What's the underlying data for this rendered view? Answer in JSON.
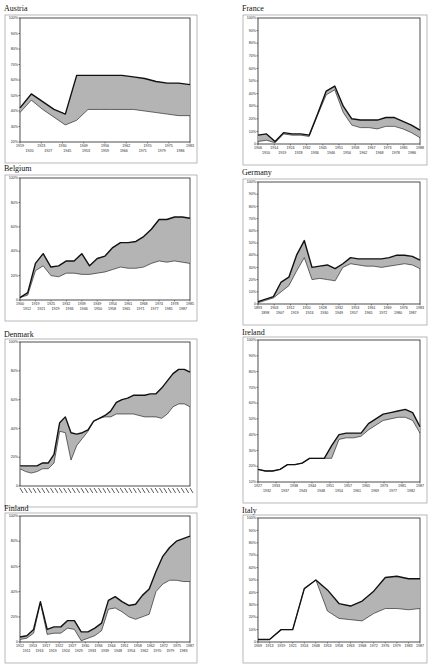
{
  "chart_data": [
    {
      "type": "area",
      "title": "Austria",
      "ylim": [
        20,
        100
      ],
      "yticks": [
        20,
        30,
        40,
        50,
        60,
        70,
        80,
        90,
        100
      ],
      "ytick_suffix": "%",
      "xticks_row1": [
        "1919",
        "1923",
        "1930",
        "1949",
        "1956",
        "1962",
        "1970",
        "1975",
        "1983"
      ],
      "xticks_row2": [
        "1920",
        "1927",
        "1945",
        "1953",
        "1959",
        "1966",
        "1971",
        "1979",
        "1986"
      ],
      "series": [
        {
          "name": "upper",
          "values": [
            42,
            51,
            46,
            41,
            38,
            63,
            63,
            63,
            63,
            63,
            62,
            61,
            59,
            58,
            58,
            57
          ]
        },
        {
          "name": "lower",
          "values": [
            39,
            47,
            41,
            36,
            31,
            34,
            41,
            41,
            41,
            41,
            41,
            40,
            39,
            38,
            37,
            37
          ]
        }
      ]
    },
    {
      "type": "area",
      "title": "France",
      "ylim": [
        0,
        100
      ],
      "yticks": [
        0,
        10,
        20,
        30,
        40,
        50,
        60,
        70,
        80,
        90,
        100
      ],
      "ytick_suffix": "%",
      "xticks_row1": [
        "1906",
        "1914",
        "1924",
        "1932",
        "1945",
        "1951",
        "1958",
        "1967",
        "1973",
        "1981",
        "1988"
      ],
      "xticks_row2": [
        "1910",
        "1919",
        "1928",
        "1936",
        "1946",
        "1956",
        "1962",
        "1968",
        "1978",
        "1986"
      ],
      "series": [
        {
          "name": "upper",
          "values": [
            7,
            8,
            2,
            9,
            8,
            8,
            7,
            24,
            42,
            46,
            30,
            20,
            19,
            19,
            19,
            21,
            21,
            18,
            15,
            11
          ]
        },
        {
          "name": "lower",
          "values": [
            2,
            3,
            1,
            8,
            7,
            7,
            6,
            23,
            39,
            43,
            25,
            15,
            13,
            13,
            12,
            14,
            14,
            12,
            9,
            5
          ]
        }
      ]
    },
    {
      "type": "area",
      "title": "Belgium",
      "ylim": [
        0,
        100
      ],
      "yticks": [
        0,
        20,
        40,
        60,
        80,
        100
      ],
      "ytick_suffix": "%",
      "xticks_row1": [
        "1900",
        "1919",
        "1925",
        "1932",
        "1939",
        "1949",
        "1954",
        "1961",
        "1968",
        "1974",
        "1978",
        "1985"
      ],
      "xticks_row2": [
        "1912",
        "1921",
        "1929",
        "1936",
        "1946",
        "1950",
        "1958",
        "1965",
        "1971",
        "1977",
        "1981",
        "1987"
      ],
      "series": [
        {
          "name": "upper",
          "values": [
            2,
            6,
            30,
            38,
            27,
            28,
            32,
            32,
            38,
            28,
            34,
            36,
            43,
            47,
            47,
            48,
            52,
            58,
            66,
            66,
            68,
            68,
            67
          ]
        },
        {
          "name": "lower",
          "values": [
            2,
            4,
            24,
            28,
            20,
            19,
            22,
            22,
            21,
            21,
            22,
            23,
            25,
            27,
            26,
            26,
            27,
            30,
            32,
            31,
            32,
            31,
            30
          ]
        }
      ]
    },
    {
      "type": "area",
      "title": "Germany",
      "ylim": [
        0,
        100
      ],
      "yticks": [
        0,
        10,
        20,
        30,
        40,
        50,
        60,
        70,
        80,
        90,
        100
      ],
      "ytick_suffix": "%",
      "xticks_row1": [
        "1893",
        "1903",
        "1912",
        "1920",
        "1928",
        "1932",
        "1953",
        "1961",
        "1969",
        "1976",
        "1983"
      ],
      "xticks_row2": [
        "1898",
        "1907",
        "1919",
        "1924",
        "1930",
        "1949",
        "1957",
        "1965",
        "1972",
        "1980",
        "1987"
      ],
      "series": [
        {
          "name": "upper",
          "values": [
            2,
            4,
            6,
            18,
            22,
            40,
            52,
            30,
            31,
            32,
            29,
            33,
            38,
            37,
            37,
            37,
            37,
            38,
            40,
            40,
            39,
            36
          ]
        },
        {
          "name": "lower",
          "values": [
            1,
            3,
            5,
            10,
            15,
            27,
            38,
            20,
            21,
            20,
            19,
            30,
            33,
            32,
            31,
            31,
            30,
            31,
            32,
            33,
            32,
            29
          ]
        }
      ]
    },
    {
      "type": "area",
      "title": "Denmark",
      "ylim": [
        0,
        100
      ],
      "yticks": [
        0,
        20,
        40,
        60,
        80,
        100
      ],
      "ytick_suffix": "%",
      "xticks_row1": [],
      "xticks_row2": [],
      "xticks_note": "rotated year labels, illegible",
      "series": [
        {
          "name": "upper",
          "values": [
            14,
            14,
            14,
            14,
            16,
            16,
            22,
            44,
            48,
            37,
            36,
            37,
            39,
            45,
            47,
            49,
            52,
            58,
            60,
            61,
            63,
            63,
            63,
            64,
            64,
            68,
            73,
            78,
            81,
            81,
            79
          ]
        },
        {
          "name": "lower",
          "values": [
            12,
            10,
            9,
            10,
            12,
            12,
            16,
            38,
            37,
            18,
            28,
            33,
            38,
            45,
            47,
            48,
            48,
            50,
            50,
            50,
            50,
            49,
            48,
            48,
            48,
            47,
            50,
            55,
            57,
            57,
            55
          ]
        }
      ]
    },
    {
      "type": "area",
      "title": "Ireland",
      "ylim": [
        10,
        100
      ],
      "yticks": [
        10,
        20,
        30,
        40,
        50,
        60,
        70,
        80,
        90,
        100
      ],
      "ytick_suffix": "%",
      "xticks_row1": [
        "1927",
        "1933",
        "1938",
        "1944",
        "1951",
        "1957",
        "1965",
        "1973",
        "1981",
        "1987"
      ],
      "xticks_row2": [
        "1932",
        "1937",
        "1943",
        "1948",
        "1954",
        "1961",
        "1969",
        "1977",
        "1982"
      ],
      "series": [
        {
          "name": "upper",
          "values": [
            18,
            17,
            17,
            18,
            21,
            21,
            22,
            25,
            25,
            25,
            33,
            40,
            41,
            41,
            41,
            47,
            50,
            53,
            54,
            55,
            56,
            54,
            45
          ]
        },
        {
          "name": "lower",
          "values": [
            18,
            17,
            17,
            18,
            21,
            21,
            22,
            25,
            25,
            25,
            25,
            37,
            38,
            38,
            39,
            43,
            46,
            49,
            50,
            51,
            51,
            49,
            41
          ]
        }
      ]
    },
    {
      "type": "area",
      "title": "Finland",
      "ylim": [
        0,
        100
      ],
      "yticks": [
        0,
        20,
        40,
        60,
        80,
        100
      ],
      "ytick_suffix": "%",
      "xticks_row1": [
        "1912",
        "1913",
        "1917",
        "1922",
        "1927",
        "1930",
        "1936",
        "1944",
        "1951",
        "1958",
        "1962",
        "1972",
        "1975",
        "1987"
      ],
      "xticks_row2": [
        "1911",
        "1916",
        "1919",
        "1924",
        "1929",
        "1933",
        "1939",
        "1948",
        "1954",
        "1962",
        "1970",
        "1979",
        "1983"
      ],
      "series": [
        {
          "name": "upper",
          "values": [
            4,
            5,
            10,
            32,
            10,
            12,
            12,
            17,
            17,
            8,
            8,
            11,
            15,
            33,
            36,
            32,
            29,
            30,
            37,
            42,
            56,
            68,
            75,
            80,
            82,
            84
          ]
        },
        {
          "name": "lower",
          "values": [
            2,
            3,
            7,
            31,
            6,
            7,
            7,
            11,
            10,
            1,
            3,
            5,
            9,
            26,
            27,
            24,
            20,
            18,
            20,
            22,
            40,
            46,
            49,
            49,
            48,
            48
          ]
        }
      ]
    },
    {
      "type": "area",
      "title": "Italy",
      "ylim": [
        0,
        100
      ],
      "yticks": [
        0,
        10,
        20,
        30,
        40,
        50,
        60,
        70,
        80,
        90,
        100
      ],
      "ytick_suffix": "%",
      "xticks_row1": [
        "1909",
        "1913",
        "1919",
        "1921",
        "1924",
        "1948",
        "1953",
        "1958",
        "1963",
        "1968",
        "1972",
        "1976",
        "1979",
        "1983",
        "1987"
      ],
      "xticks_row2": [],
      "series": [
        {
          "name": "upper",
          "values": [
            2,
            2,
            10,
            10,
            43,
            50,
            42,
            31,
            29,
            33,
            41,
            52,
            53,
            51,
            51
          ]
        },
        {
          "name": "lower",
          "values": [
            2,
            2,
            10,
            10,
            43,
            50,
            25,
            19,
            18,
            17,
            23,
            27,
            27,
            26,
            27
          ]
        }
      ]
    }
  ]
}
